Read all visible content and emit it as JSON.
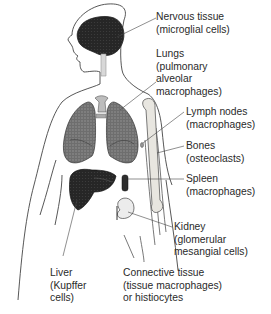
{
  "diagram": {
    "labels": [
      {
        "id": "nervous",
        "lines": [
          "Nervous tissue",
          "(microglial cells)"
        ]
      },
      {
        "id": "lungs",
        "lines": [
          "Lungs",
          "(pulmonary",
          "alveolar",
          "macrophages)"
        ]
      },
      {
        "id": "lymph",
        "lines": [
          "Lymph nodes",
          "(macrophages)"
        ]
      },
      {
        "id": "bones",
        "lines": [
          "Bones",
          "(osteoclasts)"
        ]
      },
      {
        "id": "spleen",
        "lines": [
          "Spleen",
          "(macrophages)"
        ]
      },
      {
        "id": "kidney",
        "lines": [
          "Kidney",
          "(glomerular",
          "mesangial cells)"
        ]
      },
      {
        "id": "liver",
        "lines": [
          "Liver",
          "(Kupffer",
          "cells)"
        ]
      },
      {
        "id": "connective",
        "lines": [
          "Connective tissue",
          "(tissue macrophages)",
          "or histiocytes"
        ]
      }
    ]
  }
}
